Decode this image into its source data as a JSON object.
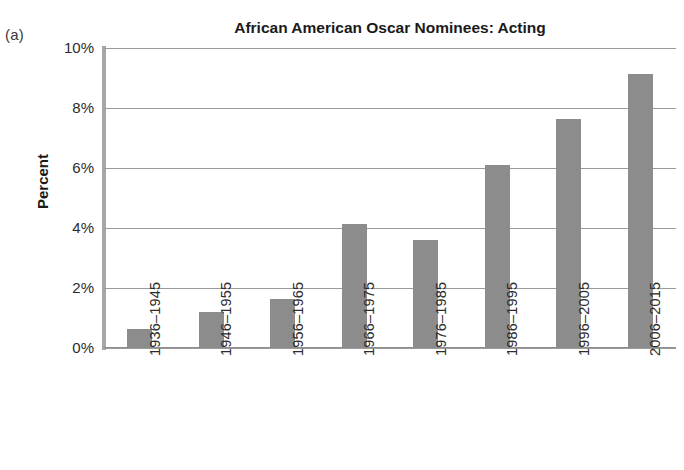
{
  "panel": {
    "label": "(a)"
  },
  "chart_data": {
    "type": "bar",
    "title": "African American Oscar Nominees: Acting",
    "xlabel": "",
    "ylabel": "Percent",
    "categories": [
      "1936–1945",
      "1946–1955",
      "1956–1965",
      "1966–1975",
      "1976–1985",
      "1986–1995",
      "1996–2005",
      "2006–2015"
    ],
    "values": [
      0.65,
      1.2,
      1.65,
      4.15,
      3.6,
      6.1,
      7.65,
      9.15
    ],
    "ylim": [
      0,
      10
    ],
    "ytick_values": [
      0,
      2,
      4,
      6,
      8,
      10
    ],
    "ytick_labels": [
      "0%",
      "2%",
      "4%",
      "6%",
      "8%",
      "10%"
    ],
    "grid": true,
    "legend": false,
    "bar_color": "#8c8c8c",
    "grid_color": "#9a9a9a",
    "axis_color": "#a7a7a7",
    "text_color": "#1a1a1a"
  }
}
